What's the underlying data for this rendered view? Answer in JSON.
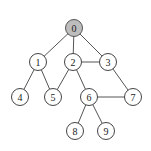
{
  "diagram": {
    "type": "graph",
    "node_radius": 8.5,
    "highlight_color": "#bdbdbd",
    "nodes": [
      {
        "id": "0",
        "label": "0",
        "x": 74,
        "y": 28,
        "highlighted": true
      },
      {
        "id": "1",
        "label": "1",
        "x": 38,
        "y": 62,
        "highlighted": false
      },
      {
        "id": "2",
        "label": "2",
        "x": 73,
        "y": 62,
        "highlighted": false
      },
      {
        "id": "3",
        "label": "3",
        "x": 108,
        "y": 62,
        "highlighted": false
      },
      {
        "id": "4",
        "label": "4",
        "x": 20,
        "y": 97,
        "highlighted": false
      },
      {
        "id": "5",
        "label": "5",
        "x": 53,
        "y": 97,
        "highlighted": false
      },
      {
        "id": "6",
        "label": "6",
        "x": 89,
        "y": 97,
        "highlighted": false
      },
      {
        "id": "7",
        "label": "7",
        "x": 133,
        "y": 97,
        "highlighted": false
      },
      {
        "id": "8",
        "label": "8",
        "x": 75,
        "y": 131,
        "highlighted": false
      },
      {
        "id": "9",
        "label": "9",
        "x": 106,
        "y": 131,
        "highlighted": false
      }
    ],
    "edges": [
      [
        "0",
        "1"
      ],
      [
        "0",
        "2"
      ],
      [
        "0",
        "3"
      ],
      [
        "1",
        "4"
      ],
      [
        "1",
        "5"
      ],
      [
        "2",
        "3"
      ],
      [
        "2",
        "5"
      ],
      [
        "2",
        "6"
      ],
      [
        "3",
        "7"
      ],
      [
        "6",
        "7"
      ],
      [
        "6",
        "8"
      ],
      [
        "6",
        "9"
      ]
    ]
  }
}
